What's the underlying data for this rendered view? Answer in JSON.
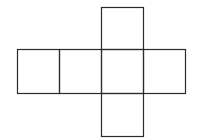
{
  "diagram": {
    "title": "",
    "type": "cube-net",
    "stroke_color": "#2b2b2b",
    "background_color": "#ffffff",
    "faces": [
      {
        "id": "top",
        "x": 101,
        "y": 7,
        "w": 42,
        "h": 42
      },
      {
        "id": "left",
        "x": 17,
        "y": 49,
        "w": 42,
        "h": 44
      },
      {
        "id": "center-left",
        "x": 59,
        "y": 49,
        "w": 42,
        "h": 44
      },
      {
        "id": "center",
        "x": 101,
        "y": 49,
        "w": 42,
        "h": 44
      },
      {
        "id": "right",
        "x": 143,
        "y": 49,
        "w": 42,
        "h": 44
      },
      {
        "id": "bottom",
        "x": 101,
        "y": 93,
        "w": 42,
        "h": 43
      }
    ]
  }
}
